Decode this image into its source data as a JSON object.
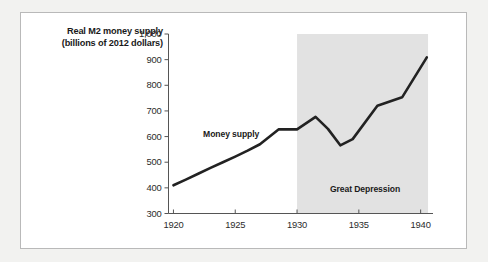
{
  "chart_data": {
    "type": "line",
    "title": "",
    "xlabel": "",
    "ylabel": "Real M2 money supply (billions of 2012 dollars)",
    "xlim": [
      1919.6,
      1941.0
    ],
    "ylim": [
      300,
      1000
    ],
    "grid": false,
    "legend_position": "inline-annotation",
    "xticks": [
      "1920",
      "1925",
      "1930",
      "1935",
      "1940"
    ],
    "xtick_values": [
      1920,
      1925,
      1930,
      1935,
      1940
    ],
    "yticks": [
      "300",
      "400",
      "500",
      "600",
      "700",
      "800",
      "900",
      "1,000"
    ],
    "ytick_values": [
      300,
      400,
      500,
      600,
      700,
      800,
      900,
      1000
    ],
    "series": [
      {
        "name": "Money supply",
        "color": "#222222",
        "x": [
          1920.0,
          1921.0,
          1922.0,
          1923.0,
          1924.0,
          1925.0,
          1926.0,
          1927.0,
          1928.5,
          1930.0,
          1931.5,
          1932.5,
          1933.5,
          1934.5,
          1936.5,
          1938.5,
          1940.5
        ],
        "values": [
          410,
          432,
          455,
          478,
          500,
          522,
          545,
          570,
          628,
          628,
          677,
          630,
          566,
          590,
          720,
          753,
          909
        ]
      }
    ],
    "annotations": [
      {
        "name": "series-label",
        "text": "Money supply",
        "x": 1922.4,
        "y": 608
      },
      {
        "name": "region-label",
        "text": "Great Depression",
        "x": 1935.5,
        "y": 390
      }
    ],
    "shaded_regions": [
      {
        "name": "Great Depression",
        "x_start": 1930.0,
        "x_end": 1940.6,
        "color": "#e2e2e2",
        "y_start": 300,
        "y_end": 1000
      }
    ]
  },
  "figure": {
    "background": "#ffffff",
    "border_color": "#b9b9b9",
    "page_background": "#f2f2f0",
    "axis_color": "#555555"
  }
}
